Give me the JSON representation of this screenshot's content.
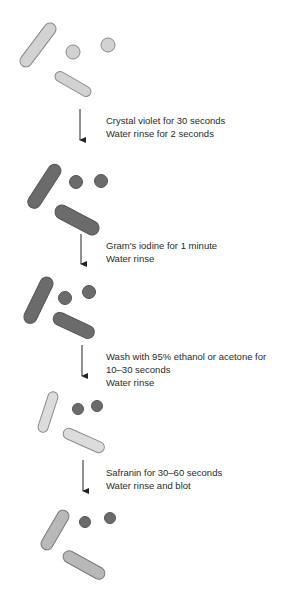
{
  "diagram": {
    "colors": {
      "unstained_fill": "#d2d2d2",
      "unstained_stroke": "#8a8a8a",
      "dark_fill": "#6b6b6b",
      "dark_stroke": "#555555",
      "decolorized_fill": "#dcdcdc",
      "decolorized_stroke": "#8c8c8c",
      "counterstain_fill": "#b8b8b8",
      "counterstain_stroke": "#7a7a7a",
      "arrow": "#222222",
      "text": "#2a2a2a"
    },
    "stages": [
      {
        "name": "unstained-cells"
      },
      {
        "name": "after-crystal-violet"
      },
      {
        "name": "after-iodine"
      },
      {
        "name": "after-decolorization"
      },
      {
        "name": "after-safranin"
      }
    ],
    "steps": [
      {
        "lines": [
          "Crystal violet for 30 seconds",
          "Water rinse for 2 seconds"
        ]
      },
      {
        "lines": [
          "Gram's iodine for 1 minute",
          "Water rinse"
        ]
      },
      {
        "lines": [
          "Wash with 95% ethanol or acetone for",
          "10–30 seconds",
          "Water rinse"
        ]
      },
      {
        "lines": [
          "Safranin for 30–60 seconds",
          "Water rinse and blot"
        ]
      }
    ]
  }
}
